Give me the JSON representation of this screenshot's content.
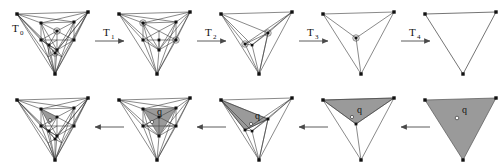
{
  "figure": {
    "background": "#ffffff",
    "width": 502,
    "height": 164,
    "colors": {
      "line": "#3a3a3a",
      "vertex": "#111111",
      "shade_fill": "#9a9a9a",
      "shade_stroke": "#555555",
      "arrow": "#4a4a4a",
      "label": "#111111",
      "query_dot": "#ffffff"
    },
    "rows": [
      {
        "name": "top-row",
        "direction": "left-to-right",
        "description": "coarsening sequence T0 to T4"
      },
      {
        "name": "bottom-row",
        "direction": "right-to-left",
        "description": "point location refinement of query q"
      }
    ],
    "transitions": [
      {
        "id": "T0",
        "base": "T",
        "sub": "0"
      },
      {
        "id": "T1",
        "base": "T",
        "sub": "1"
      },
      {
        "id": "T2",
        "base": "T",
        "sub": "2"
      },
      {
        "id": "T3",
        "base": "T",
        "sub": "3"
      },
      {
        "id": "T4",
        "base": "T",
        "sub": "4"
      }
    ],
    "query_label": "q",
    "panels_top": [
      {
        "name": "panel-t0",
        "label": "T0",
        "level": 0,
        "shaded": false
      },
      {
        "name": "panel-t1",
        "label": "T1",
        "level": 1,
        "shaded": false
      },
      {
        "name": "panel-t2",
        "label": "T2",
        "level": 2,
        "shaded": false
      },
      {
        "name": "panel-t3",
        "label": "T3",
        "level": 3,
        "shaded": false
      },
      {
        "name": "panel-t4",
        "label": "T4",
        "level": 4,
        "shaded": false
      }
    ],
    "panels_bottom": [
      {
        "name": "panel-q0",
        "query": "q",
        "level": 0,
        "shaded": true
      },
      {
        "name": "panel-q1",
        "query": "q",
        "level": 1,
        "shaded": true
      },
      {
        "name": "panel-q2",
        "query": "q",
        "level": 2,
        "shaded": true
      },
      {
        "name": "panel-q3",
        "query": "q",
        "level": 3,
        "shaded": true
      },
      {
        "name": "panel-q4",
        "query": "q",
        "level": 4,
        "shaded": true
      }
    ]
  }
}
